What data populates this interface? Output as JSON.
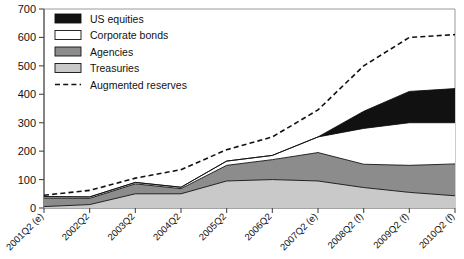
{
  "chart_data": {
    "type": "area",
    "title": "",
    "xlabel": "",
    "ylabel": "",
    "stacked": true,
    "grid": false,
    "legend_position": "top-left",
    "ylim": [
      0,
      700
    ],
    "yticks": [
      0,
      100,
      200,
      300,
      400,
      500,
      600,
      700
    ],
    "ytick_labels": [
      "0",
      "100",
      "200",
      "300",
      "400",
      "500",
      "600",
      "700"
    ],
    "categories": [
      "2001Q2 (e)",
      "2002Q2",
      "2003Q2",
      "2004Q2",
      "2005Q2",
      "2006Q2",
      "2007Q2 (e)",
      "2008Q2 (f)",
      "2009Q2 (f)",
      "2010Q2 (f)"
    ],
    "series": [
      {
        "name": "Treasuries",
        "color": "#c9c9c9",
        "values": [
          5,
          12,
          50,
          50,
          95,
          100,
          95,
          72,
          55,
          43
        ]
      },
      {
        "name": "Agencies",
        "color": "#8c8c8c",
        "values": [
          30,
          22,
          35,
          18,
          55,
          70,
          100,
          82,
          95,
          112
        ]
      },
      {
        "name": "Corporate bonds",
        "color": "#ffffff",
        "values": [
          5,
          5,
          5,
          5,
          15,
          15,
          55,
          126,
          150,
          145
        ]
      },
      {
        "name": "US equities",
        "color": "#111111",
        "values": [
          0,
          0,
          0,
          0,
          0,
          0,
          0,
          60,
          110,
          120
        ]
      }
    ],
    "line_series": [
      {
        "name": "Augmented reserves",
        "style": "dashed",
        "color": "#111111",
        "values": [
          45,
          62,
          105,
          135,
          205,
          250,
          345,
          500,
          600,
          610
        ]
      }
    ]
  },
  "legend": {
    "items": [
      {
        "label": "US equities",
        "swatch": "black",
        "type": "area"
      },
      {
        "label": "Corporate bonds",
        "swatch": "white",
        "type": "area"
      },
      {
        "label": "Agencies",
        "swatch": "dark-gray",
        "type": "area"
      },
      {
        "label": "Treasuries",
        "swatch": "light-gray",
        "type": "area"
      },
      {
        "label": "Augmented reserves",
        "swatch": "dashed",
        "type": "line"
      }
    ]
  }
}
